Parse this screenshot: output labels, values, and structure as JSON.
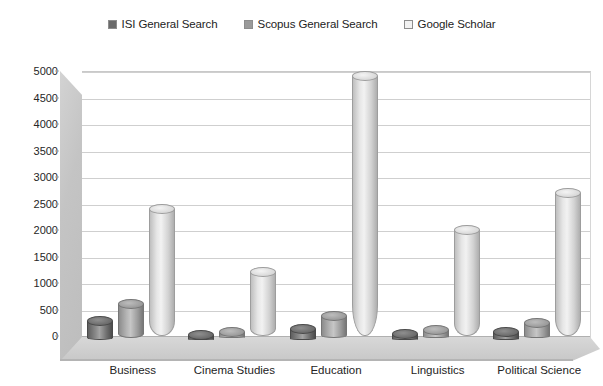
{
  "chart_data": {
    "type": "bar",
    "title": "",
    "subtitle": "",
    "xlabel": "",
    "ylabel": "",
    "ylim": [
      0,
      5000
    ],
    "ytick_step": 500,
    "yticks": [
      0,
      500,
      1000,
      1500,
      2000,
      2500,
      3000,
      3500,
      4000,
      4500,
      5000
    ],
    "grid": true,
    "legend_position": "top-center",
    "style": "3d-cylinder",
    "categories": [
      "Business",
      "Cinema Studies",
      "Education",
      "Linguistics",
      "Political Science"
    ],
    "series": [
      {
        "name": "ISI General Search",
        "color": "#6a6a6a",
        "values": [
          350,
          90,
          200,
          110,
          150
        ]
      },
      {
        "name": "Scopus General Search",
        "color": "#9a9a9a",
        "values": [
          650,
          120,
          420,
          150,
          290
        ]
      },
      {
        "name": "Google Scholar",
        "color": "#e8e8e8",
        "values": [
          2400,
          1200,
          4900,
          2000,
          2700
        ]
      }
    ]
  },
  "legend": {
    "entries": [
      {
        "label": "ISI General Search",
        "swatch": "#6a6a6a"
      },
      {
        "label": "Scopus General Search",
        "swatch": "#9a9a9a"
      },
      {
        "label": "Google Scholar",
        "swatch": "#f2f2f2"
      }
    ]
  },
  "colors": {
    "gridline": "#cfcfcf",
    "axis": "#b0b0b0",
    "text": "#232323",
    "wall": "#c4c4c4",
    "floor": "#d0d0d0",
    "background": "#ffffff"
  }
}
